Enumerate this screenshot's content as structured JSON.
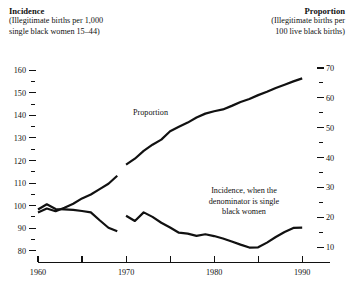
{
  "header": {
    "left": {
      "title": "Incidence",
      "line1": "(Illegitimate births per 1,000",
      "line2": "single black women 15–44)"
    },
    "right": {
      "title": "Proportion",
      "line1": "(Illegitimate births per",
      "line2": "100 live black births)"
    }
  },
  "annotations": {
    "proportion": "Proportion",
    "incidence_line1": "Incidence, when the",
    "incidence_line2": "denominator is single",
    "incidence_line3": "black women"
  },
  "chart_data": {
    "type": "line",
    "title": "",
    "xlabel": "",
    "ylabel": "Incidence (Illegitimate births per 1,000 single black women 15–44)",
    "y2label": "Proportion (Illegitimate births per 100 live black births)",
    "xlim": [
      1960,
      1991
    ],
    "ylim": [
      75,
      165
    ],
    "y2lim": [
      5,
      73
    ],
    "grid": false,
    "legend": "inline-annotations",
    "line_color": "#111111",
    "xticks_major": [
      1960,
      1965,
      1970,
      1975,
      1980,
      1985,
      1990
    ],
    "xticklabels": [
      "1960",
      "",
      "1970",
      "",
      "1980",
      "",
      "1990"
    ],
    "yticks_major": [
      80,
      90,
      100,
      110,
      120,
      130,
      140,
      150,
      160
    ],
    "yticklabels": [
      "80",
      "90",
      "100",
      "110",
      "120",
      "130",
      "140",
      "150",
      "160"
    ],
    "yticks_minor": [
      85,
      95,
      105,
      115,
      125,
      135,
      145,
      155
    ],
    "y2ticks_major": [
      10,
      20,
      30,
      40,
      50,
      60,
      70
    ],
    "y2ticklabels": [
      "10",
      "20",
      "30",
      "40",
      "50",
      "60",
      "70"
    ],
    "y2ticks_minor": [
      15,
      25,
      35,
      45,
      55,
      65
    ],
    "series": [
      {
        "name": "Proportion",
        "axis": "right",
        "note": "Illegitimate births per 100 live black births; break in series at 1969/1970",
        "segments": [
          {
            "x": [
              1960,
              1961,
              1962,
              1963,
              1964,
              1965,
              1966,
              1967,
              1968,
              1969
            ],
            "y": [
              21.6,
              22.9,
              22.0,
              23.2,
              24.5,
              26.3,
              27.6,
              29.4,
              31.2,
              33.9
            ]
          },
          {
            "x": [
              1970,
              1971,
              1972,
              1973,
              1974,
              1975,
              1976,
              1977,
              1978,
              1979,
              1980,
              1981,
              1982,
              1983,
              1984,
              1985,
              1986,
              1987,
              1988,
              1989,
              1990
            ],
            "y": [
              37.6,
              39.6,
              42.2,
              44.3,
              46.0,
              48.8,
              50.3,
              51.7,
              53.4,
              54.7,
              55.5,
              56.1,
              57.3,
              58.6,
              59.6,
              60.9,
              62.0,
              63.3,
              64.4,
              65.5,
              66.5
            ]
          }
        ]
      },
      {
        "name": "Incidence",
        "axis": "left",
        "note": "Illegitimate births per 1,000 single black women 15-44; break in series at 1969/1970",
        "segments": [
          {
            "x": [
              1960,
              1961,
              1962,
              1963,
              1964,
              1965,
              1966,
              1967,
              1968,
              1969
            ],
            "y": [
              98.3,
              100.6,
              98.5,
              98.3,
              98.1,
              97.6,
              97.0,
              93.5,
              90.2,
              88.6
            ]
          },
          {
            "x": [
              1970,
              1971,
              1972,
              1973,
              1974,
              1975,
              1976,
              1977,
              1978,
              1979,
              1980,
              1981,
              1982,
              1983,
              1984,
              1985,
              1986,
              1987,
              1988,
              1989,
              1990
            ],
            "y": [
              95.5,
              93.2,
              97.0,
              95.0,
              92.4,
              90.3,
              88.0,
              87.6,
              86.6,
              87.3,
              86.5,
              85.4,
              84.1,
              82.7,
              81.4,
              81.5,
              83.6,
              86.1,
              88.3,
              90.1,
              90.2
            ]
          }
        ]
      }
    ]
  }
}
